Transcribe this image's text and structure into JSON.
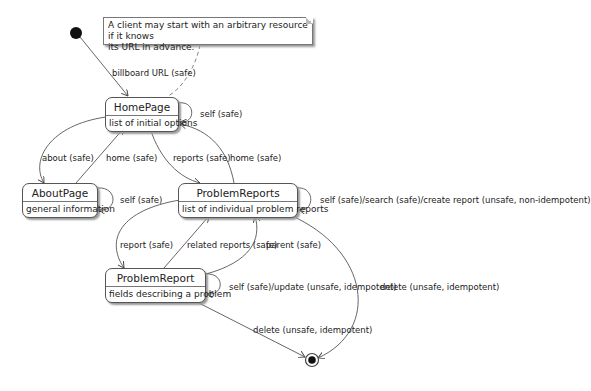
{
  "note": {
    "text_line1": "A client may start with an arbitrary resource if it knows",
    "text_line2": "its URL in advance."
  },
  "states": [
    {
      "name": "HomePage",
      "description": "list of initial options"
    },
    {
      "name": "AboutPage",
      "description": "general information"
    },
    {
      "name": "ProblemReports",
      "description": "list of individual problem reports"
    },
    {
      "name": "ProblemReport",
      "description": "fields describing a problem"
    }
  ],
  "transitions": {
    "billboard": "billboard URL (safe)",
    "home_self": "self (safe)",
    "about": "about (safe)",
    "about_home": "home (safe)",
    "reports": "reports (safe)",
    "reports_home": "home (safe)",
    "about_self": "self (safe)",
    "reports_self": "self (safe)/search (safe)/create report (unsafe, non-idempotent)",
    "report": "report (safe)",
    "related": "related reports (safe)",
    "parent": "parent (safe)",
    "report_self": "self (safe)/update (unsafe, idempotent)",
    "reports_delete": "delete (unsafe, idempotent)",
    "report_delete": "delete (unsafe, idempotent)"
  }
}
